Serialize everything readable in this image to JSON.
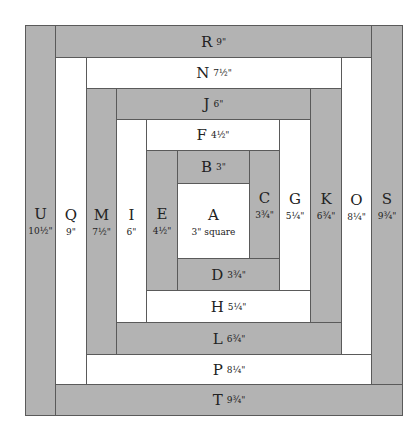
{
  "fill": {
    "gray": "#b3b3b3",
    "white": "#ffffff"
  },
  "pieces": {
    "A": {
      "letter": "A",
      "size": "3\" square"
    },
    "B": {
      "letter": "B",
      "size": "3\""
    },
    "C": {
      "letter": "C",
      "size": "3¾\""
    },
    "D": {
      "letter": "D",
      "size": "3¾\""
    },
    "E": {
      "letter": "E",
      "size": "4½\""
    },
    "F": {
      "letter": "F",
      "size": "4½\""
    },
    "G": {
      "letter": "G",
      "size": "5¼\""
    },
    "H": {
      "letter": "H",
      "size": "5¼\""
    },
    "I": {
      "letter": "I",
      "size": "6\""
    },
    "J": {
      "letter": "J",
      "size": "6\""
    },
    "K": {
      "letter": "K",
      "size": "6¾\""
    },
    "L": {
      "letter": "L",
      "size": "6¾\""
    },
    "M": {
      "letter": "M",
      "size": "7½\""
    },
    "N": {
      "letter": "N",
      "size": "7½\""
    },
    "O": {
      "letter": "O",
      "size": "8¼\""
    },
    "P": {
      "letter": "P",
      "size": "8¼\""
    },
    "Q": {
      "letter": "Q",
      "size": "9\""
    },
    "R": {
      "letter": "R",
      "size": "9\""
    },
    "S": {
      "letter": "S",
      "size": "9¾\""
    },
    "T": {
      "letter": "T",
      "size": "9¾\""
    },
    "U": {
      "letter": "U",
      "size": "10½\""
    }
  }
}
